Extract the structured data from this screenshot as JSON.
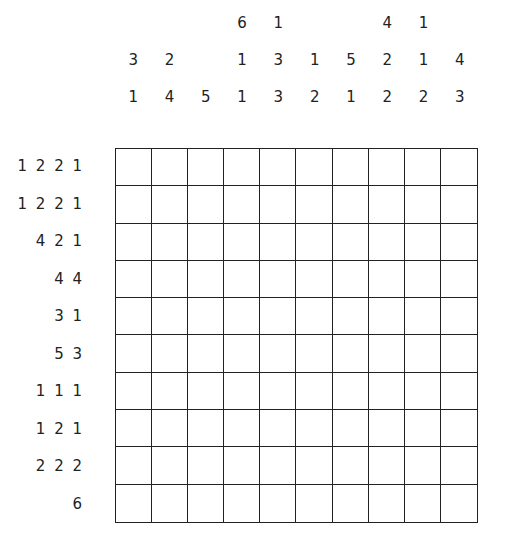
{
  "puzzle": {
    "type": "nonogram",
    "size": {
      "rows": 10,
      "cols": 10
    },
    "column_clues": [
      [
        "3",
        "1"
      ],
      [
        "2",
        "4"
      ],
      [
        "5"
      ],
      [
        "6",
        "1",
        "1"
      ],
      [
        "1",
        "3",
        "3"
      ],
      [
        "1",
        "2"
      ],
      [
        "5",
        "1"
      ],
      [
        "4",
        "2",
        "2"
      ],
      [
        "1",
        "1",
        "2"
      ],
      [
        "4",
        "3"
      ]
    ],
    "row_clues": [
      "1 2 2 1",
      "1 2 2 1",
      "4 2 1",
      "4 4",
      "3 1",
      "5 3",
      "1 1 1",
      "1 2 1",
      "2 2 2",
      "6"
    ]
  }
}
